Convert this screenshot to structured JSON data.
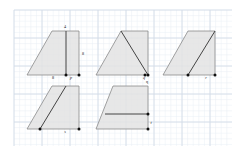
{
  "canvas": {
    "width": 246,
    "height": 153,
    "background_color": "#ffffff"
  },
  "grid": {
    "minor_spacing": 5.6,
    "major_spacing": 28,
    "minor_color": "#e8eef5",
    "major_color": "#d4dde8",
    "inset_left": 14,
    "inset_top": 10,
    "inset_right": 232,
    "inset_bottom": 146
  },
  "style": {
    "shape_fill": "#e3e3e3",
    "shape_fill_opacity": 0.85,
    "shape_stroke": "#8a8a8a",
    "shape_stroke_width": 0.8,
    "segment_stroke": "#444444",
    "segment_stroke_width": 1.0,
    "vertex_dot_color": "#111111",
    "vertex_dot_radius": 1.5,
    "label_color": "#222222"
  },
  "figures": [
    {
      "id": "figure-p",
      "name": "trapezoid-with-height-segment",
      "label": "p",
      "label_pos": {
        "x": 71,
        "y": 79
      },
      "outline": "27,75 52,31 79,31 79,75",
      "segments": [
        {
          "name": "height-segment",
          "x1": 66,
          "y1": 31,
          "x2": 66,
          "y2": 75
        }
      ],
      "vertices": [
        {
          "x": 66,
          "y": 75
        },
        {
          "x": 79,
          "y": 75
        }
      ],
      "dimension_labels": [
        {
          "text": "4",
          "x": 65,
          "y": 28,
          "anchor": "middle"
        },
        {
          "text": "8",
          "x": 82,
          "y": 55,
          "anchor": "start"
        },
        {
          "text": "8",
          "x": 53,
          "y": 79,
          "anchor": "middle"
        }
      ]
    },
    {
      "id": "figure-q",
      "name": "triangle-inside-trapezoid",
      "label": "q",
      "label_pos": {
        "x": 144,
        "y": 79
      },
      "outline": "96,75 121,31 148,31 148,75",
      "segments": [
        {
          "name": "diagonal-segment",
          "x1": 121,
          "y1": 31,
          "x2": 148,
          "y2": 75
        }
      ],
      "vertices": [
        {
          "x": 145,
          "y": 75
        },
        {
          "x": 148,
          "y": 75
        }
      ],
      "dimension_labels": []
    },
    {
      "id": "figure-r",
      "name": "parallelogram-with-diagonal",
      "label": "r",
      "label_pos": {
        "x": 206,
        "y": 79
      },
      "outline": "163,75 188,31 215,31 215,75",
      "segments": [
        {
          "name": "diagonal-segment",
          "x1": 188,
          "y1": 75,
          "x2": 215,
          "y2": 31
        }
      ],
      "vertices": [
        {
          "x": 188,
          "y": 75
        },
        {
          "x": 215,
          "y": 75
        }
      ],
      "dimension_labels": []
    },
    {
      "id": "figure-s",
      "name": "parallelogram-with-slant-segment",
      "label": "s",
      "label_pos": {
        "x": 65,
        "y": 133
      },
      "outline": "27,129 52,86 79,86 79,129",
      "segments": [
        {
          "name": "slant-segment",
          "x1": 40,
          "y1": 129,
          "x2": 66,
          "y2": 86
        }
      ],
      "vertices": [
        {
          "x": 40,
          "y": 129
        },
        {
          "x": 79,
          "y": 129
        }
      ],
      "dimension_labels": []
    },
    {
      "id": "figure-t",
      "name": "trapezoid-with-horizontal-segment",
      "label": "t",
      "label_pos": {
        "x": 151,
        "y": 124
      },
      "outline": "96,129 113,86 148,86 148,129",
      "segments": [
        {
          "name": "horizontal-segment",
          "x1": 105,
          "y1": 114,
          "x2": 148,
          "y2": 114
        }
      ],
      "vertices": [
        {
          "x": 148,
          "y": 114
        },
        {
          "x": 148,
          "y": 129
        }
      ],
      "dimension_labels": [
        {
          "text": "q",
          "x": 147,
          "y": 83,
          "anchor": "middle"
        }
      ]
    }
  ]
}
